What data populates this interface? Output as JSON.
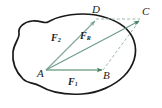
{
  "figure": {
    "type": "physics-force-diagram",
    "background_color": "#ffffff",
    "body_outline_color": "#1a1a1a",
    "vector_color": "#3f7f5f",
    "construction_color": "#8fae9d",
    "label_color": "#1a1a1a",
    "points": [
      {
        "id": "A",
        "label": "A",
        "x": 42,
        "y": 72
      },
      {
        "id": "B",
        "label": "B",
        "x": 106,
        "y": 73
      },
      {
        "id": "C",
        "label": "C",
        "x": 144,
        "y": 13
      },
      {
        "id": "D",
        "label": "D",
        "x": 95,
        "y": 11
      }
    ],
    "vectors": [
      {
        "id": "F1",
        "label": "F",
        "subscript": "1",
        "from": "A",
        "to": "B",
        "label_x": 70,
        "label_y": 79,
        "style": "solid-arrow"
      },
      {
        "id": "F2",
        "label": "F",
        "subscript": "2",
        "from": "A",
        "to": "D",
        "label_x": 53,
        "label_y": 35,
        "style": "solid-arrow"
      },
      {
        "id": "FR",
        "label": "F",
        "subscript": "R",
        "from": "A",
        "to": "C",
        "label_x": 82,
        "label_y": 33,
        "style": "solid-arrow"
      }
    ],
    "construction_lines": [
      {
        "id": "DC",
        "from": "D",
        "to": "C",
        "style": "dashed"
      },
      {
        "id": "BC",
        "from": "B",
        "to": "C",
        "style": "dashed"
      }
    ]
  }
}
